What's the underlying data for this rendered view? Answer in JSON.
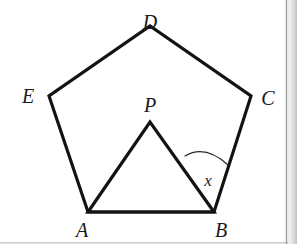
{
  "figure": {
    "kind": "geometry-diagram",
    "canvas": {
      "width": 297,
      "height": 252
    },
    "colors": {
      "stroke": "#131313",
      "background": "#ffffff",
      "arc": "#2b2b2b",
      "label": "#1a1a1a"
    },
    "stroke_widths": {
      "pentagon": 3.2,
      "triangle": 3.2,
      "arc": 1.2
    },
    "points": {
      "A": {
        "x": 88,
        "y": 212,
        "label": "A"
      },
      "B": {
        "x": 214,
        "y": 212,
        "label": "B"
      },
      "C": {
        "x": 251,
        "y": 96,
        "label": "C"
      },
      "D": {
        "x": 150,
        "y": 26,
        "label": "D"
      },
      "E": {
        "x": 49,
        "y": 96,
        "label": "E"
      },
      "P": {
        "x": 150,
        "y": 122,
        "label": "P"
      }
    },
    "shapes": {
      "pentagon": {
        "name": "pentagon-ABCDE",
        "vertex_order": [
          "A",
          "B",
          "C",
          "D",
          "E"
        ],
        "path": "M 88 212 L 214 212 L 251 96 L 150 26 L 49 96 Z"
      },
      "triangle": {
        "name": "triangle-APB",
        "vertex_order": [
          "A",
          "P",
          "B"
        ],
        "path": "M 88 212 L 150 122 L 214 212 Z"
      }
    },
    "angle_marks": [
      {
        "name": "angle-x-at-B",
        "vertex": "B",
        "from_ray_to": "P",
        "to_ray_to": "C",
        "label": "x",
        "arc_path": "M 185 156 Q 205 144 228 165",
        "label_pos": {
          "x": 208,
          "y": 180
        }
      }
    ],
    "labels": [
      {
        "name": "vertex-label-D",
        "text": "D",
        "x": 150,
        "y": 12,
        "size": "lg"
      },
      {
        "name": "vertex-label-E",
        "text": "E",
        "x": 28,
        "y": 96,
        "size": "lg"
      },
      {
        "name": "vertex-label-C",
        "text": "C",
        "x": 268,
        "y": 98,
        "size": "lg"
      },
      {
        "name": "vertex-label-P",
        "text": "P",
        "x": 150,
        "y": 105,
        "size": "lg"
      },
      {
        "name": "vertex-label-A",
        "text": "A",
        "x": 82,
        "y": 230,
        "size": "lg"
      },
      {
        "name": "vertex-label-B",
        "text": "B",
        "x": 221,
        "y": 230,
        "size": "lg"
      },
      {
        "name": "angle-label-x",
        "text": "x",
        "x": 208,
        "y": 180,
        "size": "sm"
      }
    ]
  }
}
